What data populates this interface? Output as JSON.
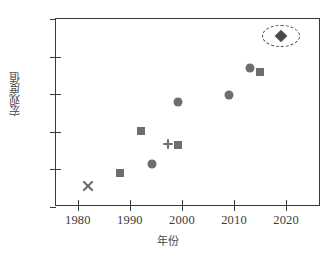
{
  "chart_data": {
    "type": "scatter",
    "title": "",
    "xlabel": "年份",
    "ylabel": "宏观度值",
    "xlim": [
      1975.8,
      2026.7
    ],
    "ylim": [
      5,
      15
    ],
    "xticks": [
      1980,
      1990,
      2000,
      2010,
      2020
    ],
    "xtick_labels": [
      "1980",
      "1990",
      "2000",
      "2010",
      "2020"
    ],
    "yticks": [
      5,
      7,
      9,
      11,
      13,
      15
    ],
    "ytick_labels": [
      "5",
      "7",
      "9",
      "11",
      "13",
      "15"
    ],
    "grid": false,
    "legend": null,
    "series": [
      {
        "name": "cross-marker",
        "marker": "x",
        "color": "#6e6e6e",
        "points": [
          {
            "x": 1982.0,
            "y": 6.1
          }
        ]
      },
      {
        "name": "square-marker",
        "marker": "square",
        "color": "#6e6e6e",
        "points": [
          {
            "x": 1988.0,
            "y": 6.8
          },
          {
            "x": 1992.2,
            "y": 9.05
          },
          {
            "x": 1999.2,
            "y": 8.3
          },
          {
            "x": 2015.0,
            "y": 12.2
          }
        ]
      },
      {
        "name": "circle-marker",
        "marker": "circle",
        "color": "#6e6e6e",
        "points": [
          {
            "x": 1994.3,
            "y": 7.3
          },
          {
            "x": 1999.2,
            "y": 10.6
          },
          {
            "x": 2009.1,
            "y": 10.95
          },
          {
            "x": 2013.0,
            "y": 12.4
          }
        ]
      },
      {
        "name": "plus-marker",
        "marker": "plus",
        "color": "#6e6e6e",
        "points": [
          {
            "x": 1997.3,
            "y": 8.35
          }
        ]
      },
      {
        "name": "diamond-marker-highlighted",
        "marker": "diamond",
        "color": "#4a4a4a",
        "points": [
          {
            "x": 2019.0,
            "y": 14.1
          }
        ]
      }
    ],
    "annotations": [
      {
        "type": "dashed-ellipse",
        "name": "highlight-ellipse",
        "x": 2019.0,
        "y": 14.1,
        "width_years": 7.3,
        "height_units": 1.18
      }
    ]
  }
}
